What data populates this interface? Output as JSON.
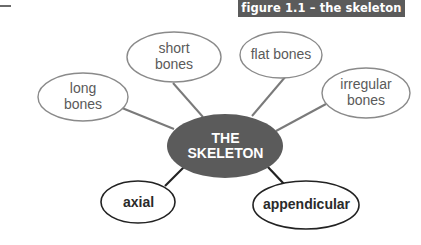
{
  "figure": {
    "caption": "figure 1.1 – the skeleton"
  },
  "diagram": {
    "center": {
      "label": "THE\nSKELETON",
      "fill": "#5b5b5b",
      "text_color": "#ffffff"
    },
    "bone_types": [
      {
        "id": "long",
        "label": "long\nbones"
      },
      {
        "id": "short",
        "label": "short\nbones"
      },
      {
        "id": "flat",
        "label": "flat bones"
      },
      {
        "id": "irregular",
        "label": "irregular\nbones"
      }
    ],
    "divisions": [
      {
        "id": "axial",
        "label": "axial"
      },
      {
        "id": "appendicular",
        "label": "appendicular"
      }
    ],
    "colors": {
      "bone_type_outline": "#8a8a8a",
      "bone_type_text": "#5a5a5a",
      "division_outline": "#222222",
      "division_text": "#2a2a2a",
      "connector_grey": "#7a7a7a",
      "connector_dark": "#222222"
    }
  }
}
